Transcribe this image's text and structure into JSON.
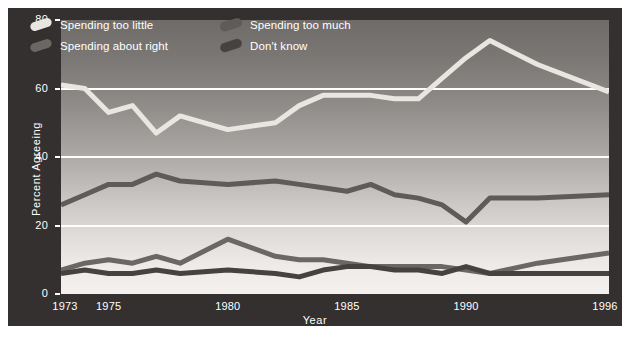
{
  "chart_data": {
    "type": "line",
    "title": "",
    "xlabel": "Year",
    "ylabel": "Percent Agreeing",
    "xlim": [
      1973,
      1996
    ],
    "ylim": [
      0,
      80
    ],
    "grid": true,
    "gridlines_y": [
      20,
      40,
      60
    ],
    "legend_position": "top-left-inside",
    "ytick_labels": [
      "0",
      "20",
      "40",
      "60",
      "80"
    ],
    "ytick_values": [
      0,
      20,
      40,
      60,
      80
    ],
    "xtick_labels": [
      "1973",
      "1975",
      "1980",
      "1985",
      "1990",
      "1996"
    ],
    "xtick_values": [
      1973,
      1975,
      1980,
      1985,
      1990,
      1996
    ],
    "x": [
      1973,
      1974,
      1975,
      1976,
      1977,
      1978,
      1980,
      1982,
      1983,
      1984,
      1985,
      1986,
      1987,
      1988,
      1989,
      1990,
      1991,
      1993,
      1996
    ],
    "series": [
      {
        "name": "Spending too little",
        "color": "#e8e6e1",
        "values": [
          61,
          60,
          53,
          55,
          47,
          52,
          48,
          50,
          55,
          58,
          58,
          58,
          57,
          57,
          63,
          69,
          74,
          67,
          59
        ]
      },
      {
        "name": "Spending too much",
        "color": "#5e5b58",
        "values": [
          26,
          29,
          32,
          32,
          35,
          33,
          32,
          33,
          32,
          31,
          30,
          32,
          29,
          28,
          26,
          21,
          28,
          28,
          29
        ]
      },
      {
        "name": "Spending about right",
        "color": "#6a6764",
        "values": [
          7,
          9,
          10,
          9,
          11,
          9,
          16,
          11,
          10,
          10,
          9,
          8,
          8,
          8,
          8,
          7,
          6,
          9,
          12
        ]
      },
      {
        "name": "Don't know",
        "color": "#454240",
        "values": [
          6,
          7,
          6,
          6,
          7,
          6,
          7,
          6,
          5,
          7,
          8,
          8,
          7,
          7,
          6,
          8,
          6,
          6,
          6
        ]
      }
    ]
  },
  "legend": {
    "items": [
      {
        "label": "Spending too little",
        "color": "#e8e6e1"
      },
      {
        "label": "Spending too much",
        "color": "#5e5b58"
      },
      {
        "label": "Spending about right",
        "color": "#6a6764"
      },
      {
        "label": "Don't know",
        "color": "#454240"
      }
    ]
  },
  "axes": {
    "y_title": "Percent Agreeing",
    "x_title": "Year",
    "y_ticks": [
      "80",
      "60",
      "40",
      "20",
      "0"
    ],
    "x_ticks": [
      "1973",
      "1975",
      "1980",
      "1985",
      "1990",
      "1996"
    ]
  },
  "colors": {
    "frame": "#33302f",
    "gridline": "#ffffff",
    "axis_text": "#ffffff",
    "page": "#ffffff"
  }
}
